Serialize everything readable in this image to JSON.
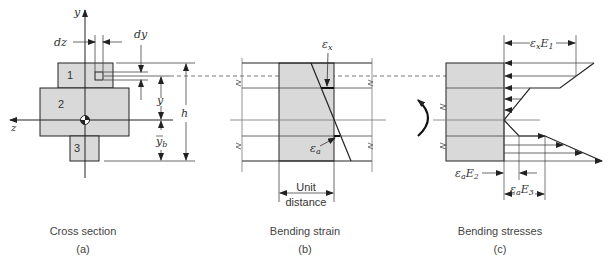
{
  "figure": {
    "panels": [
      {
        "id": "a",
        "caption": "Cross section",
        "sublabel": "(a)",
        "axis_labels": {
          "y": "y",
          "z": "z"
        },
        "region_labels": [
          "1",
          "2",
          "3"
        ],
        "dimension_labels": {
          "dz": "dz",
          "dy": "dy",
          "y": "y",
          "yb": "y",
          "yb_sub": "b",
          "h": "h"
        }
      },
      {
        "id": "b",
        "caption": "Bending strain",
        "sublabel": "(b)",
        "strain_labels": {
          "ex": "ε",
          "ex_sub": "x",
          "ea": "ε",
          "ea_sub": "a"
        },
        "unit_label_line1": "Unit",
        "unit_label_line2": "distance"
      },
      {
        "id": "c",
        "caption": "Bending stresses",
        "sublabel": "(c)",
        "stress_labels": {
          "exE1": {
            "eps": "ε",
            "sub": "x",
            "E": "E",
            "Esub": "1"
          },
          "eaE2": {
            "eps": "ε",
            "sub": "a",
            "E": "E",
            "Esub": "2"
          },
          "eaE3": {
            "eps": "ε",
            "sub": "a",
            "E": "E",
            "Esub": "3"
          }
        }
      }
    ],
    "colors": {
      "fill": "#d9d9d9",
      "line": "#222222",
      "thin": "#555555",
      "text": "#333333"
    }
  }
}
